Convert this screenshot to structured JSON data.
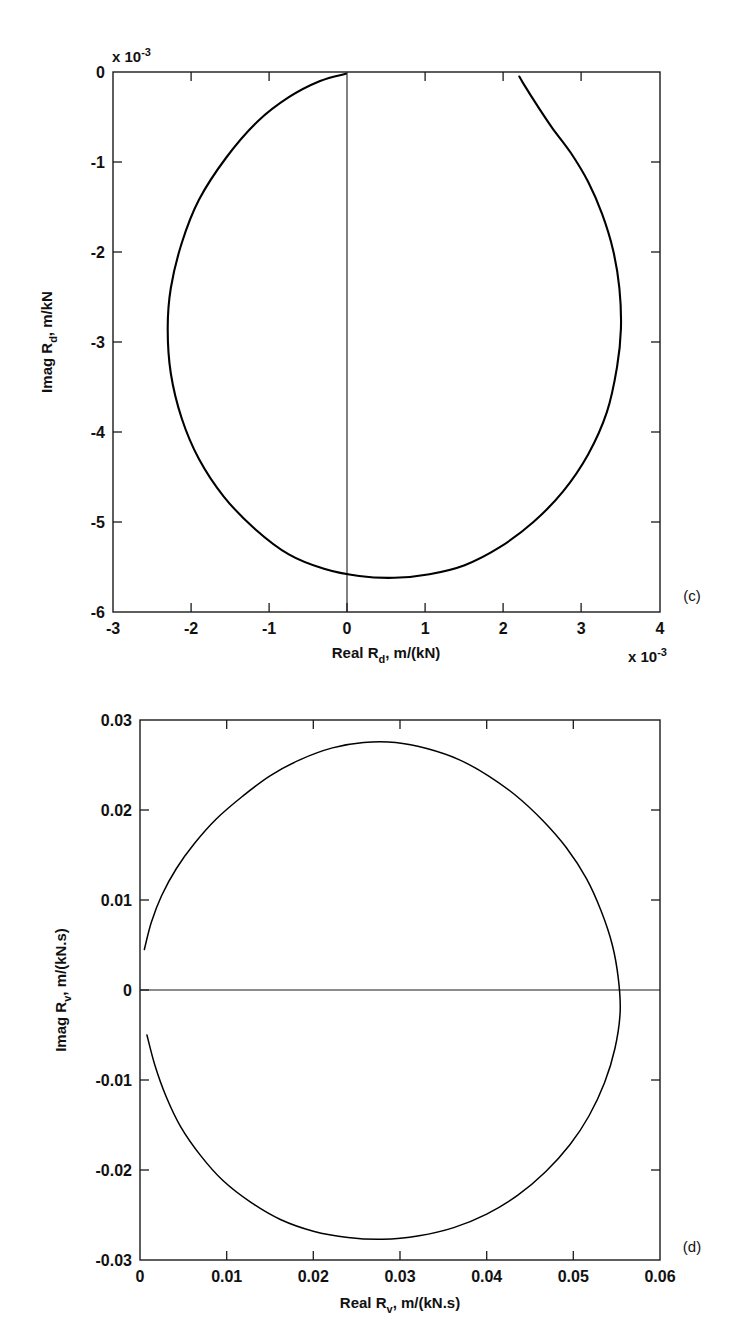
{
  "figure": {
    "background": "#ffffff",
    "line_color": "#000000",
    "panels": [
      {
        "tag": "(c)",
        "chart_data": {
          "type": "line",
          "title": "",
          "subtitle": "",
          "xlabel_main": "Real R",
          "xlabel_sub": "d",
          "xlabel_rest": ", m/(kN)",
          "ylabel_main": "Imag R",
          "ylabel_sub": "d",
          "ylabel_rest": ", m/kN",
          "x_exponent_prefix": "x 10",
          "x_exponent_power": "-3",
          "y_exponent_prefix": "x 10",
          "y_exponent_power": "-3",
          "xlim": [
            -3,
            4
          ],
          "ylim": [
            -6,
            0
          ],
          "xticks": [
            "-3",
            "-2",
            "-1",
            "0",
            "1",
            "2",
            "3",
            "4"
          ],
          "xtick_values": [
            -3,
            -2,
            -1,
            0,
            1,
            2,
            3,
            4
          ],
          "yticks": [
            "0",
            "-1",
            "-2",
            "-3",
            "-4",
            "-5",
            "-6"
          ],
          "ytick_values": [
            0,
            -1,
            -2,
            -3,
            -4,
            -5,
            -6
          ],
          "grid": false,
          "legend": "none",
          "zero_reference_line": {
            "orientation": "vertical",
            "value": 0
          },
          "series": [
            {
              "name": "Rd Nyquist locus",
              "comment": "near-circular locus, center approx (0.6, -2.85), radius approx 2.85 in units of 1e-3",
              "points": [
                [
                  -0.02,
                  -0.02
                ],
                [
                  -0.35,
                  -0.1
                ],
                [
                  -0.75,
                  -0.28
                ],
                [
                  -1.15,
                  -0.55
                ],
                [
                  -1.55,
                  -0.95
                ],
                [
                  -1.9,
                  -1.42
                ],
                [
                  -2.12,
                  -1.9
                ],
                [
                  -2.26,
                  -2.4
                ],
                [
                  -2.3,
                  -2.85
                ],
                [
                  -2.26,
                  -3.35
                ],
                [
                  -2.12,
                  -3.85
                ],
                [
                  -1.9,
                  -4.3
                ],
                [
                  -1.58,
                  -4.72
                ],
                [
                  -1.18,
                  -5.08
                ],
                [
                  -0.75,
                  -5.36
                ],
                [
                  -0.3,
                  -5.52
                ],
                [
                  0.15,
                  -5.6
                ],
                [
                  0.6,
                  -5.62
                ],
                [
                  1.05,
                  -5.58
                ],
                [
                  1.5,
                  -5.48
                ],
                [
                  1.95,
                  -5.28
                ],
                [
                  2.38,
                  -5.0
                ],
                [
                  2.76,
                  -4.66
                ],
                [
                  3.08,
                  -4.25
                ],
                [
                  3.32,
                  -3.78
                ],
                [
                  3.45,
                  -3.28
                ],
                [
                  3.5,
                  -2.85
                ],
                [
                  3.48,
                  -2.4
                ],
                [
                  3.4,
                  -1.98
                ],
                [
                  3.26,
                  -1.58
                ],
                [
                  3.08,
                  -1.22
                ],
                [
                  2.86,
                  -0.9
                ],
                [
                  2.62,
                  -0.62
                ],
                [
                  2.42,
                  -0.36
                ],
                [
                  2.26,
                  -0.14
                ],
                [
                  2.2,
                  -0.05
                ]
              ]
            }
          ]
        }
      },
      {
        "tag": "(d)",
        "chart_data": {
          "type": "line",
          "title": "",
          "subtitle": "",
          "xlabel_main": "Real R",
          "xlabel_sub": "v",
          "xlabel_rest": ", m/(kN.s)",
          "ylabel_main": "Imag R",
          "ylabel_sub": "v",
          "ylabel_rest": ", m/(kN.s)",
          "xlim": [
            0,
            0.06
          ],
          "ylim": [
            -0.03,
            0.03
          ],
          "xticks": [
            "0",
            "0.01",
            "0.02",
            "0.03",
            "0.04",
            "0.05",
            "0.06"
          ],
          "xtick_values": [
            0,
            0.01,
            0.02,
            0.03,
            0.04,
            0.05,
            0.06
          ],
          "yticks": [
            "0.03",
            "0.02",
            "0.01",
            "0",
            "-0.01",
            "-0.02",
            "-0.03"
          ],
          "ytick_values": [
            0.03,
            0.02,
            0.01,
            0,
            -0.01,
            -0.02,
            -0.03
          ],
          "grid": false,
          "legend": "none",
          "zero_reference_line": {
            "orientation": "horizontal",
            "value": 0
          },
          "series": [
            {
              "name": "Rv Nyquist locus",
              "comment": "near-circular locus, center approx (0.0278, 0.0), radius approx 0.0277",
              "points": [
                [
                  0.0005,
                  0.0045
                ],
                [
                  0.0013,
                  0.0075
                ],
                [
                  0.0025,
                  0.0105
                ],
                [
                  0.0042,
                  0.0135
                ],
                [
                  0.0063,
                  0.0163
                ],
                [
                  0.0088,
                  0.019
                ],
                [
                  0.0118,
                  0.0215
                ],
                [
                  0.015,
                  0.0238
                ],
                [
                  0.0185,
                  0.0256
                ],
                [
                  0.0222,
                  0.0269
                ],
                [
                  0.0258,
                  0.0275
                ],
                [
                  0.0295,
                  0.0275
                ],
                [
                  0.0332,
                  0.0268
                ],
                [
                  0.0368,
                  0.0256
                ],
                [
                  0.0402,
                  0.0238
                ],
                [
                  0.0435,
                  0.0215
                ],
                [
                  0.0465,
                  0.0188
                ],
                [
                  0.0492,
                  0.0158
                ],
                [
                  0.0515,
                  0.0124
                ],
                [
                  0.0532,
                  0.0088
                ],
                [
                  0.0545,
                  0.005
                ],
                [
                  0.0552,
                  0.0012
                ],
                [
                  0.0554,
                  -0.0025
                ],
                [
                  0.0548,
                  -0.0065
                ],
                [
                  0.0536,
                  -0.0103
                ],
                [
                  0.0518,
                  -0.014
                ],
                [
                  0.0496,
                  -0.0172
                ],
                [
                  0.0468,
                  -0.0202
                ],
                [
                  0.0436,
                  -0.0228
                ],
                [
                  0.04,
                  -0.0249
                ],
                [
                  0.0362,
                  -0.0264
                ],
                [
                  0.0322,
                  -0.0273
                ],
                [
                  0.028,
                  -0.0277
                ],
                [
                  0.024,
                  -0.0275
                ],
                [
                  0.02,
                  -0.0268
                ],
                [
                  0.0162,
                  -0.0255
                ],
                [
                  0.0128,
                  -0.0236
                ],
                [
                  0.0096,
                  -0.0212
                ],
                [
                  0.007,
                  -0.0184
                ],
                [
                  0.0047,
                  -0.0152
                ],
                [
                  0.003,
                  -0.0118
                ],
                [
                  0.0017,
                  -0.0083
                ],
                [
                  0.0008,
                  -0.005
                ]
              ]
            }
          ]
        }
      }
    ]
  }
}
